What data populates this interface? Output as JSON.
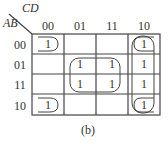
{
  "diagram": {
    "type": "karnaugh-map",
    "col_var": "CD",
    "row_var": "AB",
    "col_headers": [
      "00",
      "01",
      "11",
      "10"
    ],
    "row_headers": [
      "00",
      "01",
      "11",
      "10"
    ],
    "cells": [
      [
        "1",
        "",
        "",
        "1"
      ],
      [
        "",
        "1",
        "1",
        "1"
      ],
      [
        "",
        "1",
        "1",
        "1"
      ],
      [
        "1",
        "",
        "",
        "1"
      ]
    ],
    "groups": [
      "corners (AB=00,10 × CD=00,10)",
      "center square (AB=01,11 × CD=01,11)",
      "column CD=10 (all rows)"
    ],
    "caption": "(b)"
  }
}
